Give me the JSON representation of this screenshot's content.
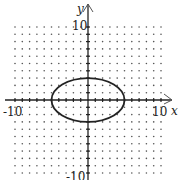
{
  "chart_data": {
    "type": "line",
    "title": "",
    "xlabel": "x",
    "ylabel": "y",
    "xlim": [
      -10,
      10
    ],
    "ylim": [
      -10,
      10
    ],
    "grid": "dots",
    "tick_labels": {
      "x": [
        "-10",
        "10"
      ],
      "y": [
        "10",
        "-10"
      ]
    },
    "series": [
      {
        "name": "ellipse",
        "equation": "x^2/25 + y^2/9 = 1",
        "center": [
          0,
          0
        ],
        "semi_axis_x": 5,
        "semi_axis_y": 3
      }
    ]
  },
  "labels": {
    "x_axis": "x",
    "y_axis": "y",
    "x_min": "-10",
    "x_max": "10",
    "y_max": "10",
    "y_min": "-10"
  },
  "colors": {
    "axis": "#222222",
    "curve": "#222222",
    "grid_dot": "#555555"
  }
}
